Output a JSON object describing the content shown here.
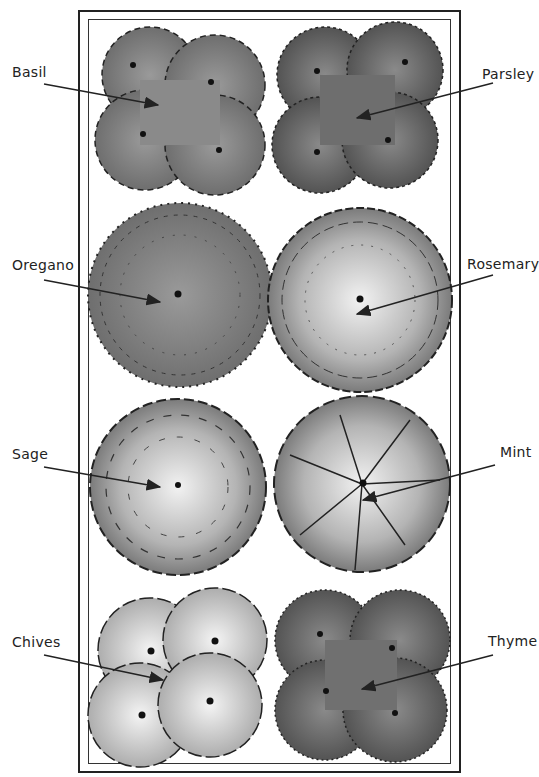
{
  "diagram": {
    "type": "herb-garden-planting-plan",
    "labels": {
      "basil": "Basil",
      "parsley": "Parsley",
      "oregano": "Oregano",
      "rosemary": "Rosemary",
      "sage": "Sage",
      "mint": "Mint",
      "chives": "Chives",
      "thyme": "Thyme"
    },
    "plants": [
      {
        "key": "basil",
        "column": "left",
        "row": 1,
        "plant_count": 4
      },
      {
        "key": "parsley",
        "column": "right",
        "row": 1,
        "plant_count": 4
      },
      {
        "key": "oregano",
        "column": "left",
        "row": 2,
        "plant_count": 1
      },
      {
        "key": "rosemary",
        "column": "right",
        "row": 2,
        "plant_count": 1
      },
      {
        "key": "sage",
        "column": "left",
        "row": 3,
        "plant_count": 1
      },
      {
        "key": "mint",
        "column": "right",
        "row": 3,
        "plant_count": 1
      },
      {
        "key": "chives",
        "column": "left",
        "row": 4,
        "plant_count": 4
      },
      {
        "key": "thyme",
        "column": "right",
        "row": 4,
        "plant_count": 4
      }
    ],
    "colors": {
      "ink": "#222222",
      "foliage_dark": "#6e6e6e",
      "foliage_mid": "#8f8f8f",
      "foliage_light": "#c8c8c8",
      "background": "#ffffff"
    }
  }
}
